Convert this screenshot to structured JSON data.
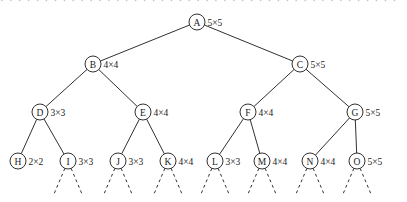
{
  "figure": {
    "top_strip_text": "· · · · · · · · · · · · · · · · · · · · · · · · · · · · · · · · · · · · · · · · · · · · ·",
    "stroke_color": "#1a1a1a",
    "background_color": "#ffffff"
  },
  "chart_data": {
    "type": "diagram",
    "subtype": "tree",
    "title": "",
    "node_label_format": "w×h",
    "nodes": [
      {
        "id": "A",
        "letter": "A",
        "label": "5×5",
        "x": 197,
        "y": 22,
        "level": 0,
        "r": 8
      },
      {
        "id": "B",
        "letter": "B",
        "label": "4×4",
        "x": 93,
        "y": 64,
        "level": 1,
        "r": 8
      },
      {
        "id": "C",
        "letter": "C",
        "label": "5×5",
        "x": 300,
        "y": 64,
        "level": 1,
        "r": 8
      },
      {
        "id": "D",
        "letter": "D",
        "label": "3×3",
        "x": 40,
        "y": 112,
        "level": 2,
        "r": 8
      },
      {
        "id": "E",
        "letter": "E",
        "label": "4×4",
        "x": 143,
        "y": 112,
        "level": 2,
        "r": 8
      },
      {
        "id": "F",
        "letter": "F",
        "label": "4×4",
        "x": 248,
        "y": 112,
        "level": 2,
        "r": 8
      },
      {
        "id": "G",
        "letter": "G",
        "label": "5×5",
        "x": 355,
        "y": 112,
        "level": 2,
        "r": 8
      },
      {
        "id": "H",
        "letter": "H",
        "label": "2×2",
        "x": 18,
        "y": 161,
        "level": 3,
        "r": 8
      },
      {
        "id": "I",
        "letter": "I",
        "label": "3×3",
        "x": 68,
        "y": 161,
        "level": 3,
        "r": 8
      },
      {
        "id": "J",
        "letter": "J",
        "label": "3×3",
        "x": 118,
        "y": 161,
        "level": 3,
        "r": 8
      },
      {
        "id": "K",
        "letter": "K",
        "label": "4×4",
        "x": 168,
        "y": 161,
        "level": 3,
        "r": 8
      },
      {
        "id": "L",
        "letter": "L",
        "label": "3×3",
        "x": 215,
        "y": 161,
        "level": 3,
        "r": 8
      },
      {
        "id": "M",
        "letter": "M",
        "label": "4×4",
        "x": 262,
        "y": 161,
        "level": 3,
        "r": 8
      },
      {
        "id": "N",
        "letter": "N",
        "label": "4×4",
        "x": 310,
        "y": 161,
        "level": 3,
        "r": 8
      },
      {
        "id": "O",
        "letter": "O",
        "label": "5×5",
        "x": 357,
        "y": 161,
        "level": 3,
        "r": 8
      }
    ],
    "edges": [
      {
        "from": "A",
        "to": "B",
        "style": "solid"
      },
      {
        "from": "A",
        "to": "C",
        "style": "solid"
      },
      {
        "from": "B",
        "to": "D",
        "style": "solid"
      },
      {
        "from": "B",
        "to": "E",
        "style": "solid"
      },
      {
        "from": "C",
        "to": "F",
        "style": "solid"
      },
      {
        "from": "C",
        "to": "G",
        "style": "solid"
      },
      {
        "from": "D",
        "to": "H",
        "style": "solid"
      },
      {
        "from": "D",
        "to": "I",
        "style": "solid"
      },
      {
        "from": "E",
        "to": "J",
        "style": "solid"
      },
      {
        "from": "E",
        "to": "K",
        "style": "solid"
      },
      {
        "from": "F",
        "to": "L",
        "style": "solid"
      },
      {
        "from": "F",
        "to": "M",
        "style": "solid"
      },
      {
        "from": "G",
        "to": "N",
        "style": "solid"
      },
      {
        "from": "G",
        "to": "O",
        "style": "solid"
      }
    ],
    "continuation_edges": [
      {
        "from": "I",
        "dx": -14,
        "dy": 33,
        "style": "dashed"
      },
      {
        "from": "I",
        "dx": 14,
        "dy": 33,
        "style": "dashed"
      },
      {
        "from": "J",
        "dx": -14,
        "dy": 33,
        "style": "dashed"
      },
      {
        "from": "J",
        "dx": 14,
        "dy": 33,
        "style": "dashed"
      },
      {
        "from": "K",
        "dx": -14,
        "dy": 33,
        "style": "dashed"
      },
      {
        "from": "K",
        "dx": 14,
        "dy": 33,
        "style": "dashed"
      },
      {
        "from": "L",
        "dx": -14,
        "dy": 33,
        "style": "dashed"
      },
      {
        "from": "L",
        "dx": 14,
        "dy": 33,
        "style": "dashed"
      },
      {
        "from": "M",
        "dx": -14,
        "dy": 33,
        "style": "dashed"
      },
      {
        "from": "M",
        "dx": 14,
        "dy": 33,
        "style": "dashed"
      },
      {
        "from": "N",
        "dx": -14,
        "dy": 33,
        "style": "dashed"
      },
      {
        "from": "N",
        "dx": 14,
        "dy": 33,
        "style": "dashed"
      },
      {
        "from": "O",
        "dx": -14,
        "dy": 33,
        "style": "dashed"
      },
      {
        "from": "O",
        "dx": 14,
        "dy": 33,
        "style": "dashed"
      }
    ]
  }
}
